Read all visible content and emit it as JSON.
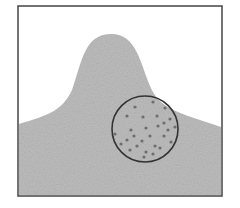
{
  "figure": {
    "frame": {
      "x": 18,
      "y": 6,
      "width": 204,
      "height": 190,
      "stroke": "#444444",
      "stroke_width": 1.5
    },
    "mound": {
      "fill": "#bdbdbd",
      "texture_color": "#a6a6a6",
      "path": "M19 124 C 45 116, 62 112, 72 90 C 82 62, 84 35, 110 34 C 136 33, 140 62, 150 86 C 160 110, 178 112, 221 127 L 221 195 L 19 195 Z"
    },
    "circle": {
      "cx": 145,
      "cy": 129,
      "r": 33,
      "stroke": "#333333",
      "stroke_width": 1.6
    },
    "dots": {
      "color": "#6e6e6e",
      "radius": 1.6,
      "points": [
        [
          153,
          102
        ],
        [
          135,
          107
        ],
        [
          165,
          108
        ],
        [
          127,
          116
        ],
        [
          143,
          117
        ],
        [
          157,
          116
        ],
        [
          170,
          119
        ],
        [
          164,
          123
        ],
        [
          158,
          126
        ],
        [
          175,
          127
        ],
        [
          131,
          130
        ],
        [
          146,
          128
        ],
        [
          168,
          130
        ],
        [
          115,
          134
        ],
        [
          134,
          136
        ],
        [
          150,
          136
        ],
        [
          164,
          136
        ],
        [
          127,
          140
        ],
        [
          142,
          141
        ],
        [
          121,
          144
        ],
        [
          137,
          146
        ],
        [
          155,
          146
        ],
        [
          171,
          142
        ],
        [
          130,
          150
        ],
        [
          146,
          152
        ],
        [
          160,
          148
        ],
        [
          144,
          157
        ],
        [
          153,
          154
        ]
      ]
    }
  }
}
